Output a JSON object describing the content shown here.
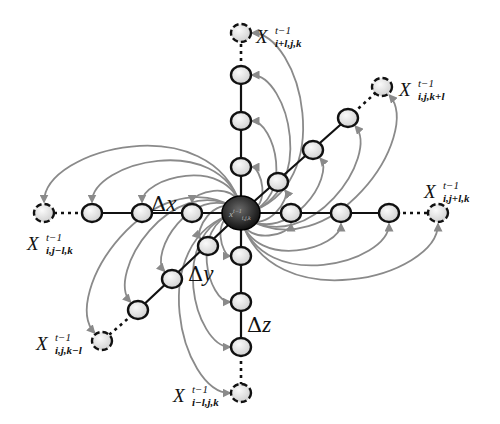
{
  "diagram": {
    "center": {
      "x": 241,
      "y": 213,
      "label": "x",
      "sup": "t−1",
      "sub": "i,j,k"
    },
    "colors": {
      "node_fill": "#e6e6e6",
      "node_stroke": "#111111",
      "edge": "#111111",
      "arrow": "#8a8a8a",
      "center": "#2a2a2a"
    },
    "axes": [
      {
        "name": "up",
        "nodes": [
          [
            241,
            167
          ],
          [
            241,
            121
          ],
          [
            241,
            75
          ]
        ],
        "end": [
          241,
          33
        ]
      },
      {
        "name": "down",
        "nodes": [
          [
            241,
            256
          ],
          [
            241,
            302
          ],
          [
            241,
            347
          ]
        ],
        "end": [
          241,
          393
        ]
      },
      {
        "name": "left",
        "nodes": [
          [
            192,
            213
          ],
          [
            142,
            213
          ],
          [
            92,
            213
          ]
        ],
        "end": [
          44,
          213
        ]
      },
      {
        "name": "right",
        "nodes": [
          [
            291,
            213
          ],
          [
            341,
            213
          ],
          [
            389,
            213
          ]
        ],
        "end": [
          438,
          213
        ]
      },
      {
        "name": "upright",
        "nodes": [
          [
            278,
            182
          ],
          [
            313,
            150
          ],
          [
            348,
            118
          ]
        ],
        "end": [
          382,
          87
        ]
      },
      {
        "name": "downleft",
        "nodes": [
          [
            208,
            246
          ],
          [
            172,
            279
          ],
          [
            138,
            310
          ]
        ],
        "end": [
          102,
          341
        ]
      }
    ],
    "labels": {
      "top": {
        "main": "X",
        "sup": "t−1",
        "sub": "i+l,j,k"
      },
      "upper_right": {
        "main": "X",
        "sup": "t−1",
        "sub": "i,j,k+l"
      },
      "right": {
        "main": "X",
        "sup": "t−1",
        "sub": "i,j+l,k"
      },
      "left": {
        "main": "X",
        "sup": "t−1",
        "sub": "i,j−l,k"
      },
      "lower_left": {
        "main": "X",
        "sup": "t−1",
        "sub": "i,j,k−l"
      },
      "bottom": {
        "main": "X",
        "sup": "t−1",
        "sub": "i−l,j,k"
      }
    },
    "deltas": {
      "dx": {
        "sym": "Δ",
        "var": "x"
      },
      "dy": {
        "sym": "Δ",
        "var": "y"
      },
      "dz": {
        "sym": "Δ",
        "var": "z"
      }
    }
  }
}
